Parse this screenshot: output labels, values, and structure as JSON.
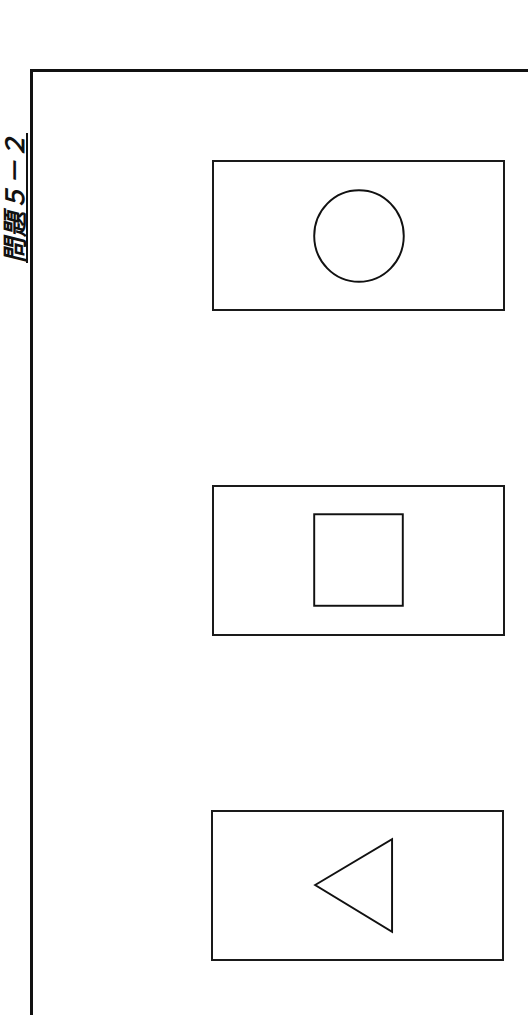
{
  "page": {
    "title": "問題５－２"
  },
  "cards": [
    {
      "label": "circle",
      "shape": "circle-icon"
    },
    {
      "label": "square",
      "shape": "square-icon"
    },
    {
      "label": "triangle",
      "shape": "triangle-left-icon"
    }
  ],
  "colors": {
    "ink": "#111111",
    "background": "#ffffff"
  }
}
